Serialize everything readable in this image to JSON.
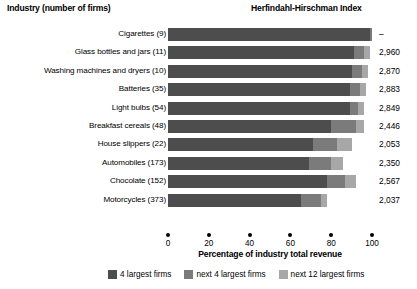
{
  "headers": {
    "industry": "Industry (number of firms)",
    "hhi": "Herfindahl-Hirschman Index"
  },
  "axis": {
    "xlabel": "Percentage of industry total revenue",
    "ticks": [
      "0",
      "20",
      "40",
      "60",
      "80",
      "100"
    ]
  },
  "legend": {
    "items": [
      {
        "label": "4 largest firms",
        "color": "#4d4d4d"
      },
      {
        "label": "next 4 largest firms",
        "color": "#7b7b7b"
      },
      {
        "label": "next 12 largest firms",
        "color": "#a7a7a7"
      }
    ]
  },
  "chart_data": {
    "type": "bar",
    "orientation": "horizontal",
    "stacked": true,
    "title": "",
    "xlabel": "Percentage of industry total revenue",
    "ylabel": "Industry (number of firms)",
    "xlim": [
      0,
      100
    ],
    "xticks": [
      0,
      20,
      40,
      60,
      80,
      100
    ],
    "grid": false,
    "legend_position": "bottom",
    "categories": [
      "Cigarettes  (9)",
      "Glass bottles and jars  (11)",
      "Washing machines and dryers  (10)",
      "Batteries  (35)",
      "Light bulbs  (54)",
      "Breakfast cereals  (48)",
      "House slippers  (22)",
      "Automobiles  (173)",
      "Chocolate  (152)",
      "Motorcycles  (373)"
    ],
    "series": [
      {
        "name": "4 largest firms",
        "values": [
          99,
          91,
          90,
          89,
          89,
          80,
          71,
          69,
          78,
          65
        ]
      },
      {
        "name": "next 4 largest firms",
        "values": [
          1,
          5,
          5,
          5,
          4,
          12,
          12,
          11,
          9,
          10
        ]
      },
      {
        "name": "next 12 largest firms",
        "values": [
          0,
          3,
          3,
          3,
          3,
          4,
          7,
          6,
          5,
          3
        ]
      }
    ],
    "annotations": {
      "hhi_label": "Herfindahl-Hirschman Index",
      "hhi_values": [
        "–",
        "2,960",
        "2,870",
        "2,883",
        "2,849",
        "2,446",
        "2,053",
        "2,350",
        "2,567",
        "2,037"
      ]
    }
  }
}
